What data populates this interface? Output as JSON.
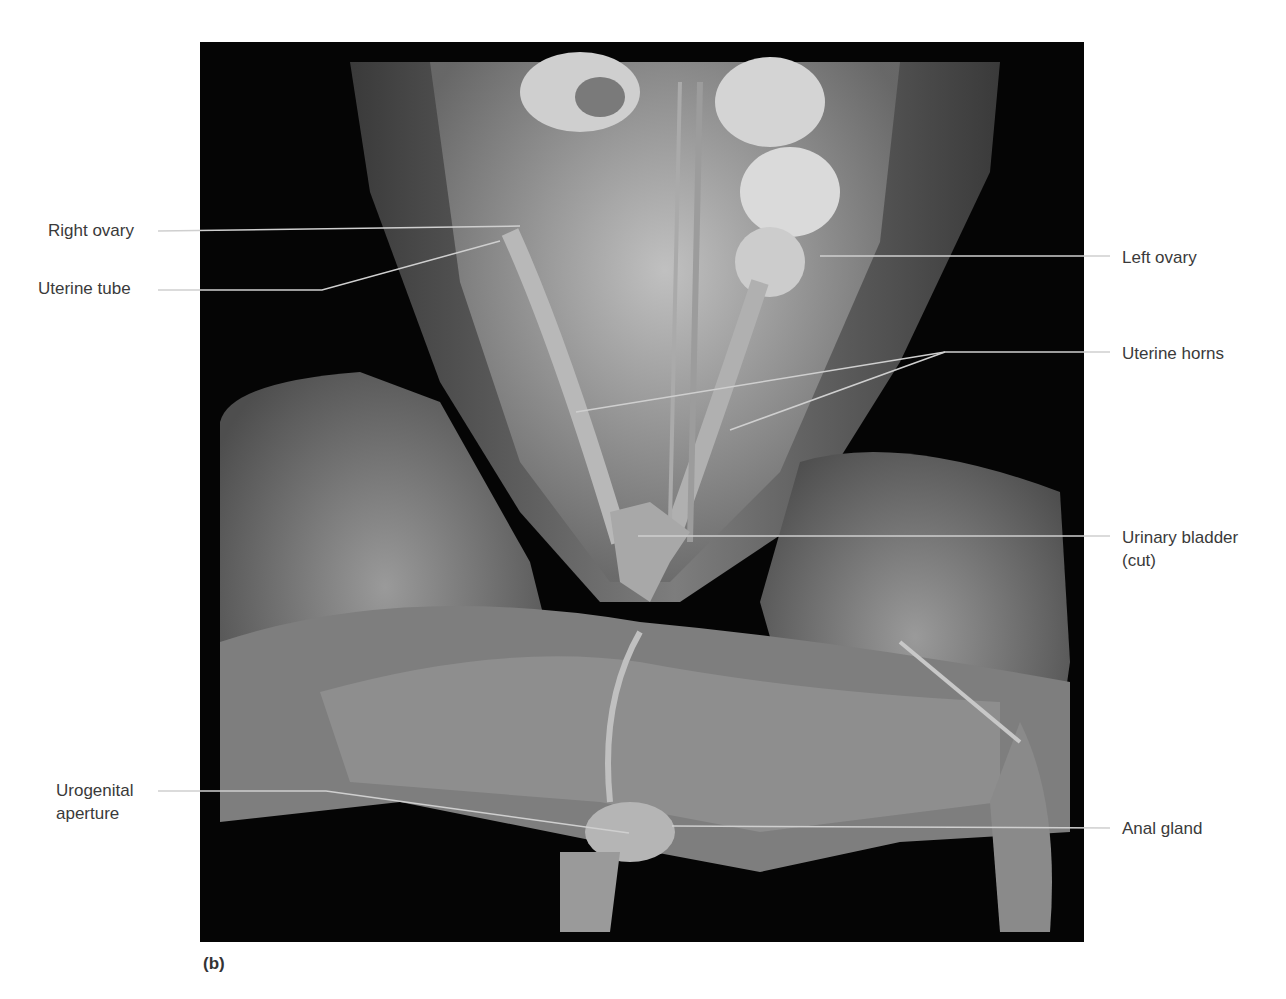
{
  "figure": {
    "panel_letter": "(b)",
    "colors": {
      "background": "#ffffff",
      "photo_background": "#050505",
      "tissue_light": "#bdbdbd",
      "tissue_mid": "#8a8a8a",
      "tissue_dark": "#5a5a5a",
      "leader_line": "#cfcfcf",
      "label_text": "#3a3a3a"
    }
  },
  "labels": {
    "right_ovary": "Right ovary",
    "uterine_tube": "Uterine tube",
    "left_ovary": "Left ovary",
    "uterine_horns": "Uterine horns",
    "urinary_bladder_line1": "Urinary bladder",
    "urinary_bladder_line2": "(cut)",
    "urogenital_line1": "Urogenital",
    "urogenital_line2": "aperture",
    "anal_gland": "Anal gland"
  }
}
